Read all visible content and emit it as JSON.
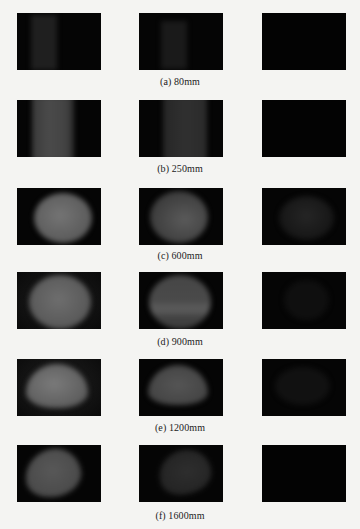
{
  "figure": {
    "rows": [
      {
        "caption": "(a)  80mm",
        "distance": "80mm"
      },
      {
        "caption": "(b)  250mm",
        "distance": "250mm"
      },
      {
        "caption": "(c)  600mm",
        "distance": "600mm"
      },
      {
        "caption": "(d)  900mm",
        "distance": "900mm"
      },
      {
        "caption": "(e)  1200mm",
        "distance": "1200mm"
      },
      {
        "caption": "(f)  1600mm",
        "distance": "1600mm"
      }
    ],
    "columns": 3,
    "panel_background": "#050505",
    "page_background": "#f4f4f2"
  }
}
